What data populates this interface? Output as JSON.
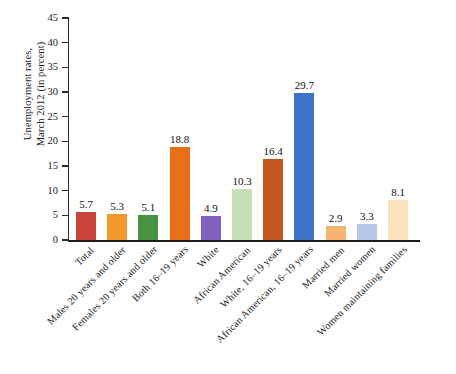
{
  "chart_data": {
    "type": "bar",
    "title": "",
    "subtitle": "",
    "xlabel": "",
    "ylabel": "Unemployment rates, March 2012 (in percent)",
    "ylabel_lines": [
      "Unemployment rates,",
      "March 2012 (in percent)"
    ],
    "ylim": [
      0,
      45
    ],
    "ytick_step": 5,
    "yticks": [
      0,
      5,
      10,
      15,
      20,
      25,
      30,
      35,
      40,
      45
    ],
    "ytick_labels": [
      "0",
      "5",
      "10",
      "15",
      "20",
      "25",
      "30",
      "35",
      "40",
      "45"
    ],
    "grid": false,
    "legend": "none",
    "value_labels_shown": true,
    "categories": [
      "Total",
      "Males 20 years and older",
      "Females 20 years and older",
      "Both 16–19 years",
      "White",
      "African American",
      "White, 16–19 years",
      "African American, 16–19 years",
      "Married men",
      "Married women",
      "Women maintaining families"
    ],
    "values": [
      5.7,
      5.3,
      5.1,
      18.8,
      4.9,
      10.3,
      16.4,
      29.7,
      2.9,
      3.3,
      8.1
    ],
    "value_label_text": [
      "5.7",
      "5.3",
      "5.1",
      "18.8",
      "4.9",
      "10.3",
      "16.4",
      "29.7",
      "2.9",
      "3.3",
      "8.1"
    ],
    "bar_colors": [
      "#c9443c",
      "#f3982d",
      "#489241",
      "#e8701a",
      "#8161bf",
      "#c5e0b4",
      "#c4571f",
      "#3f72c9",
      "#f6b472",
      "#b8c7ea",
      "#fbe3bd"
    ],
    "axis_color": "#1d1d1d",
    "text_color": "#111111",
    "background_color": "#ffffff"
  }
}
